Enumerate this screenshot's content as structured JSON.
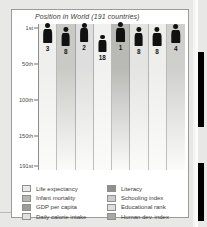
{
  "chart_data": {
    "type": "bar",
    "title": "Position in World (191 countries)",
    "xlabel": "",
    "ylabel": "",
    "ylim": [
      1,
      191
    ],
    "y_inverted": true,
    "grid": true,
    "legend_position": "bottom",
    "ticks": [
      {
        "label": "1st",
        "value": 1
      },
      {
        "label": "50th",
        "value": 50
      },
      {
        "label": "100th",
        "value": 100
      },
      {
        "label": "150th",
        "value": 150
      },
      {
        "label": "191st",
        "value": 191
      }
    ],
    "categories": [
      "Life expectancy",
      "Infant mortality",
      "GDP per capita",
      "Daily calorie intake",
      "Literacy",
      "Schooling index",
      "Educational rank",
      "Human dev. index"
    ],
    "values": [
      3,
      8,
      2,
      18,
      1,
      8,
      8,
      4
    ],
    "value_labels": [
      "3",
      "8",
      "2",
      "18",
      "1",
      "8",
      "8",
      "4"
    ],
    "band_colors": [
      "#efefed",
      "#c9c9c6",
      "#dedede",
      "#f1f1ef",
      "#b9b9b6",
      "#e4e4e2",
      "#eeeeec",
      "#cfcfcc"
    ],
    "swatch_colors": [
      "#e9e9e7",
      "#b6b6b3",
      "#9d9d9a",
      "#e1e1df",
      "#8f8f8c",
      "#cccccb",
      "#dedede",
      "#a8a8a5"
    ]
  },
  "legend": {
    "left_items": [
      {
        "label": "Life expectancy",
        "color": "#e9e9e7"
      },
      {
        "label": "Infant mortality",
        "color": "#b6b6b3"
      },
      {
        "label": "GDP per capita",
        "color": "#9d9d9a"
      },
      {
        "label": "Daily calorie intake",
        "color": "#e1e1df"
      }
    ],
    "right_items": [
      {
        "label": "Literacy",
        "color": "#8f8f8c"
      },
      {
        "label": "Schooling index",
        "color": "#cccccb"
      },
      {
        "label": "Educational rank",
        "color": "#dedede"
      },
      {
        "label": "Human dev. index",
        "color": "#a8a8a5"
      }
    ]
  }
}
